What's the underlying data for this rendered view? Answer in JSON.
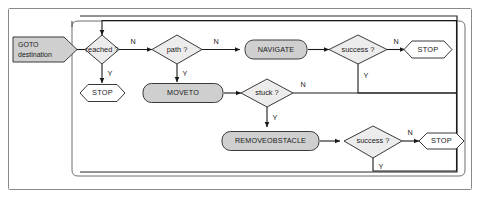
{
  "diagram": {
    "colors": {
      "process_fill": "#cfcfcf",
      "decision_fill": "#ececec",
      "terminal_fill": "#ffffff",
      "start_fill": "#cfcfcf",
      "stroke": "#3a3a3a",
      "edge": "#1a1a1a",
      "frame": "#6e6e6e",
      "background": "#ffffff"
    },
    "nodes": {
      "start": {
        "label_line1": "GOTO",
        "label_line2": "destination",
        "shape": "pentagon-arrow"
      },
      "reached": {
        "label": "reached ?",
        "shape": "diamond"
      },
      "path": {
        "label": "path ?",
        "shape": "diamond"
      },
      "navigate": {
        "label": "NAVIGATE",
        "shape": "rounded-rect"
      },
      "success_top": {
        "label": "success ?",
        "shape": "diamond"
      },
      "stop_top_right": {
        "label": "STOP",
        "shape": "hexagon"
      },
      "stop_left": {
        "label": "STOP",
        "shape": "hexagon"
      },
      "moveto": {
        "label": "MOVETO",
        "shape": "rounded-rect"
      },
      "stuck": {
        "label": "stuck ?",
        "shape": "diamond"
      },
      "removeobstacle": {
        "label": "REMOVEOBSTACLE",
        "shape": "rounded-rect"
      },
      "success_bottom": {
        "label": "success ?",
        "shape": "diamond"
      },
      "stop_bottom_right": {
        "label": "STOP",
        "shape": "hexagon"
      }
    },
    "edge_labels": {
      "reached_no": "N",
      "reached_yes": "Y",
      "path_no": "N",
      "path_yes": "Y",
      "success_top_no": "N",
      "success_top_yes": "Y",
      "stuck_no": "N",
      "stuck_yes": "Y",
      "success_bottom_no": "N",
      "success_bottom_yes": "Y"
    }
  }
}
